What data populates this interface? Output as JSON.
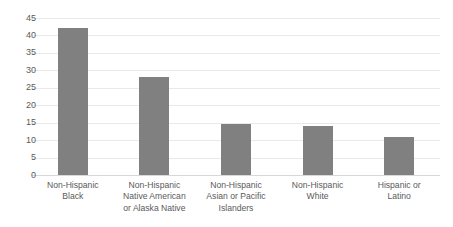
{
  "chart_data": {
    "type": "bar",
    "title": "",
    "xlabel": "",
    "ylabel": "",
    "categories": [
      "Non-Hispanic Black",
      "Non-Hispanic Native American or Alaska Native",
      "Non-Hispanic Asian or Pacific Islanders",
      "Non-Hispanic White",
      "Hispanic or Latino"
    ],
    "values": [
      42,
      28,
      14.5,
      14,
      11
    ],
    "ylim": [
      0,
      45
    ],
    "yticks": [
      45,
      40,
      35,
      30,
      25,
      20,
      15,
      10,
      5,
      0
    ],
    "ytick_labels": [
      "45",
      "40",
      "35",
      "30",
      "25",
      "20",
      "15",
      "10",
      "5",
      "0"
    ],
    "grid": true,
    "legend": false,
    "bar_color": "#808080",
    "gridline_color": "#e9e9e9",
    "text_color": "#5a5a5a"
  },
  "category_lines": [
    [
      "Non-Hispanic",
      "Black"
    ],
    [
      "Non-Hispanic",
      "Native American",
      "or Alaska Native"
    ],
    [
      "Non-Hispanic",
      "Asian or Pacific",
      "Islanders"
    ],
    [
      "Non-Hispanic",
      "White"
    ],
    [
      "Hispanic or",
      "Latino"
    ]
  ],
  "title_text": ""
}
